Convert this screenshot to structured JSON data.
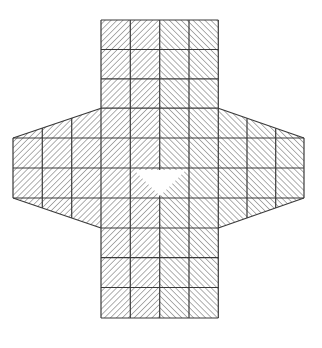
{
  "diagram": {
    "width": 322,
    "height": 348,
    "background": "#ffffff",
    "line_color": "#3a3a3a",
    "hatch_color": "#6e6e6e",
    "hatch_spacing": 4.2,
    "columns_x": [
      13,
      42.3,
      71.7,
      101,
      130.3,
      159.7,
      189,
      218.3,
      247,
      275.7,
      304
    ],
    "center_columns": [
      3,
      7
    ],
    "center_rows_y": [
      20,
      49.5,
      78.8,
      108.2,
      138,
      168,
      198,
      228,
      257.7,
      287.5,
      318
    ],
    "wing_rows": [
      4,
      6
    ],
    "wing_slope": {
      "outer_top_y": 138,
      "inner_top_y": 108.2,
      "outer_bottom_y": 198,
      "inner_bottom_y": 228
    },
    "hole": {
      "points": [
        [
          134,
          170
        ],
        [
          186,
          170
        ],
        [
          160,
          196
        ]
      ],
      "fill": "#ffffff"
    },
    "shape_label": "hatched cross-shaped mesh with triangular hole"
  }
}
